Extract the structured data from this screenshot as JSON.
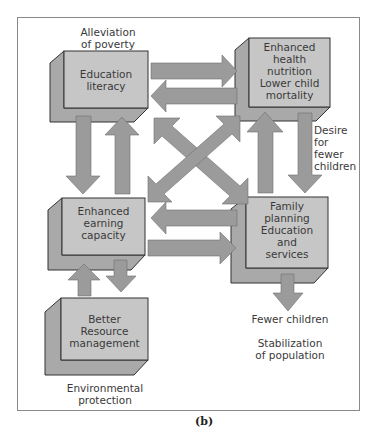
{
  "figure": {
    "caption": "(b)",
    "colors": {
      "box_face": "#c4c4c4",
      "box_side": "#a8a8a8",
      "arrow": "#9a9a9a",
      "stroke": "#333333",
      "frame": "#888888"
    }
  },
  "nodes": [
    {
      "id": "education",
      "lines": [
        "Education",
        "literacy"
      ]
    },
    {
      "id": "health",
      "lines": [
        "Enhanced",
        "health",
        "nutrition",
        "Lower child",
        "mortality"
      ]
    },
    {
      "id": "earning",
      "lines": [
        "Enhanced",
        "earning",
        "capacity"
      ]
    },
    {
      "id": "family",
      "lines": [
        "Family",
        "planning",
        "Education",
        "and",
        "services"
      ]
    },
    {
      "id": "resource",
      "lines": [
        "Better",
        "Resource",
        "management"
      ]
    }
  ],
  "labels": {
    "poverty": [
      "Alleviation",
      "of poverty"
    ],
    "desire": [
      "Desire",
      "for",
      "fewer",
      "children"
    ],
    "fewer": [
      "Fewer children"
    ],
    "stabilization": [
      "Stabilization",
      "of population"
    ],
    "environment": [
      "Environmental",
      "protection"
    ]
  },
  "edges": [
    {
      "from": "education",
      "to": "health"
    },
    {
      "from": "health",
      "to": "education"
    },
    {
      "from": "education",
      "to": "earning"
    },
    {
      "from": "earning",
      "to": "education"
    },
    {
      "from": "health",
      "to": "family",
      "label": "Desire for fewer children"
    },
    {
      "from": "family",
      "to": "health"
    },
    {
      "from": "education",
      "to": "family",
      "bidirectional": true
    },
    {
      "from": "health",
      "to": "earning",
      "bidirectional": true
    },
    {
      "from": "family",
      "to": "earning"
    },
    {
      "from": "earning",
      "to": "family"
    },
    {
      "from": "earning",
      "to": "resource"
    },
    {
      "from": "resource",
      "to": "earning"
    },
    {
      "from": "family",
      "to": "outcome",
      "label": "Fewer children"
    }
  ]
}
